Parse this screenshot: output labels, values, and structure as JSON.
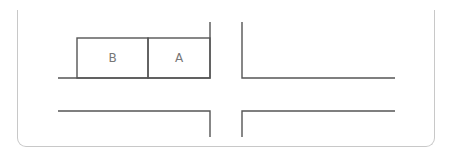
{
  "diagram": {
    "type": "parking-intersection-map",
    "spaces": [
      {
        "id": "space-b",
        "label": "B"
      },
      {
        "id": "space-a",
        "label": "A"
      }
    ],
    "colors": {
      "line": "#555555",
      "frame": "#c8c8c8",
      "label": "#777777",
      "background": "#ffffff"
    }
  }
}
